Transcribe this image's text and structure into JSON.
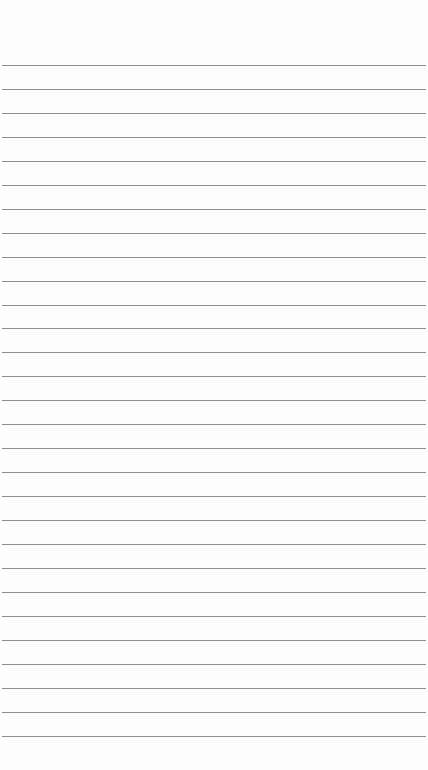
{
  "paper": {
    "type": "lined-paper",
    "line_color": "#8e8e8e",
    "background_color": "#fdfdfd",
    "first_line_y": 65,
    "line_spacing": 23.95,
    "line_count": 29
  }
}
